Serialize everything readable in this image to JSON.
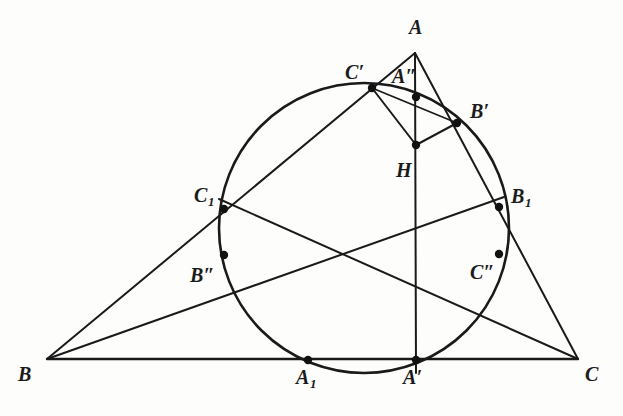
{
  "figure": {
    "kind": "euclidean-geometry-diagram",
    "stroke_color": "#1a1a1a",
    "background_color": "#fdfdfb",
    "point_color": "#111111",
    "canvas": {
      "width": 623,
      "height": 416
    }
  },
  "labels": [
    {
      "id": "A",
      "text": "A",
      "sub": "",
      "prime": "",
      "x": 409,
      "y": 17
    },
    {
      "id": "Cprime",
      "text": "C",
      "sub": "",
      "prime": "′",
      "x": 345,
      "y": 62
    },
    {
      "id": "A2prime",
      "text": "A",
      "sub": "",
      "prime": "″",
      "x": 392,
      "y": 66
    },
    {
      "id": "Bprime",
      "text": "B",
      "sub": "",
      "prime": "′",
      "x": 470,
      "y": 101
    },
    {
      "id": "H",
      "text": "H",
      "sub": "",
      "prime": "",
      "x": 396,
      "y": 160
    },
    {
      "id": "C1",
      "text": "C",
      "sub": "1",
      "prime": "",
      "x": 194,
      "y": 185
    },
    {
      "id": "B1",
      "text": "B",
      "sub": "1",
      "prime": "",
      "x": 511,
      "y": 186
    },
    {
      "id": "B2prime",
      "text": "B",
      "sub": "",
      "prime": "″",
      "x": 190,
      "y": 265
    },
    {
      "id": "C2prime",
      "text": "C",
      "sub": "",
      "prime": "″",
      "x": 470,
      "y": 262
    },
    {
      "id": "B",
      "text": "B",
      "sub": "",
      "prime": "",
      "x": 18,
      "y": 364
    },
    {
      "id": "A1",
      "text": "A",
      "sub": "1",
      "prime": "",
      "x": 296,
      "y": 367
    },
    {
      "id": "Aprime",
      "text": "A",
      "sub": "",
      "prime": "′",
      "x": 403,
      "y": 367
    },
    {
      "id": "C",
      "text": "C",
      "sub": "",
      "prime": "",
      "x": 585,
      "y": 364
    }
  ],
  "geometry": {
    "points": [
      {
        "id": "A",
        "name": "vertex-a",
        "x": 415,
        "y": 53,
        "dot": false
      },
      {
        "id": "B",
        "name": "vertex-b",
        "x": 47,
        "y": 359,
        "dot": false
      },
      {
        "id": "C",
        "name": "vertex-c",
        "x": 578,
        "y": 359,
        "dot": false
      },
      {
        "id": "Cprime",
        "name": "point-c-prime",
        "x": 372,
        "y": 88,
        "dot": true
      },
      {
        "id": "A2prime",
        "name": "point-a-double-prime",
        "x": 416,
        "y": 97,
        "dot": true
      },
      {
        "id": "Bprime",
        "name": "point-b-prime",
        "x": 457,
        "y": 123,
        "dot": true
      },
      {
        "id": "H",
        "name": "orthocenter-h",
        "x": 416,
        "y": 145,
        "dot": true
      },
      {
        "id": "C1",
        "name": "point-c-one",
        "x": 224,
        "y": 209,
        "dot": true
      },
      {
        "id": "B1",
        "name": "point-b-one",
        "x": 499,
        "y": 207,
        "dot": true
      },
      {
        "id": "B2prime",
        "name": "point-b-double-prime",
        "x": 224,
        "y": 255,
        "dot": true
      },
      {
        "id": "C2prime",
        "name": "point-c-double-prime",
        "x": 499,
        "y": 254,
        "dot": true
      },
      {
        "id": "A1",
        "name": "point-a-one",
        "x": 308,
        "y": 360,
        "dot": true
      },
      {
        "id": "Aprime",
        "name": "point-a-prime",
        "x": 416,
        "y": 360,
        "dot": true
      }
    ],
    "circle": {
      "name": "main-circle",
      "cx": 364,
      "cy": 228,
      "r": 145
    },
    "segments": [
      {
        "name": "side-bc",
        "x1": 47,
        "y1": 359,
        "x2": 578,
        "y2": 359,
        "w": 2.4
      },
      {
        "name": "side-ab",
        "x1": 47,
        "y1": 359,
        "x2": 415,
        "y2": 53,
        "w": 2.0
      },
      {
        "name": "side-ac",
        "x1": 415,
        "y1": 53,
        "x2": 578,
        "y2": 359,
        "w": 2.0
      },
      {
        "name": "altitude-a-aprime",
        "x1": 415,
        "y1": 53,
        "x2": 416,
        "y2": 373,
        "w": 2.0
      },
      {
        "name": "cevian-b-b1",
        "x1": 47,
        "y1": 359,
        "x2": 504,
        "y2": 197,
        "w": 2.0
      },
      {
        "name": "cevian-c-c1",
        "x1": 578,
        "y1": 359,
        "x2": 219,
        "y2": 199,
        "w": 2.0
      },
      {
        "name": "chord-cprime-h",
        "x1": 372,
        "y1": 88,
        "x2": 416,
        "y2": 145,
        "w": 2.0
      },
      {
        "name": "chord-h-bprime",
        "x1": 416,
        "y1": 145,
        "x2": 457,
        "y2": 123,
        "w": 2.0
      },
      {
        "name": "chord-cprime-bprime",
        "x1": 372,
        "y1": 88,
        "x2": 457,
        "y2": 123,
        "w": 1.8
      }
    ]
  }
}
